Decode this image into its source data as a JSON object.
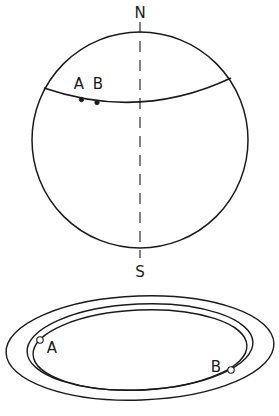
{
  "figure": {
    "background_color": "#ffffff",
    "stroke_color": "#1a1a1a",
    "width": 279,
    "height": 416
  },
  "top_panel": {
    "name": "sphere-diagram",
    "circle": {
      "cx": 140,
      "cy": 140,
      "r": 108
    },
    "axis": {
      "name": "polar-axis",
      "x": 140,
      "y_top": 22,
      "y_bottom": 258,
      "style": "dashed"
    },
    "pole_labels": [
      {
        "id": "north",
        "text": "N",
        "x": 140,
        "y": 18
      },
      {
        "id": "south",
        "text": "S",
        "x": 140,
        "y": 275
      }
    ],
    "arc": {
      "name": "great-circle-arc",
      "start": {
        "x": 44,
        "y": 88
      },
      "control": {
        "x": 140,
        "y": 118
      },
      "end": {
        "x": 231,
        "y": 78
      }
    },
    "points": [
      {
        "id": "A",
        "label": "A",
        "x": 81,
        "y": 99,
        "label_x": 79,
        "label_y": 86,
        "style": "solid"
      },
      {
        "id": "B",
        "label": "B",
        "x": 97,
        "y": 102,
        "label_x": 97,
        "label_y": 86,
        "style": "solid"
      }
    ]
  },
  "bottom_panel": {
    "name": "orbit-ellipses-diagram",
    "ellipses": [
      {
        "id": "outer",
        "cx": 140,
        "cy": 348,
        "rx": 134,
        "ry": 52,
        "rotation": -2
      },
      {
        "id": "middle",
        "cx": 140,
        "cy": 347,
        "rx": 113,
        "ry": 43,
        "rotation": -2
      },
      {
        "id": "inner",
        "cx": 140,
        "cy": 349,
        "rx": 107,
        "ry": 40,
        "rotation": -2
      }
    ],
    "points": [
      {
        "id": "A",
        "label": "A",
        "x": 40,
        "y": 340,
        "label_x": 52,
        "label_y": 352,
        "style": "open"
      },
      {
        "id": "B",
        "label": "B",
        "x": 231,
        "y": 370,
        "label_x": 216,
        "label_y": 369,
        "style": "open"
      }
    ]
  }
}
